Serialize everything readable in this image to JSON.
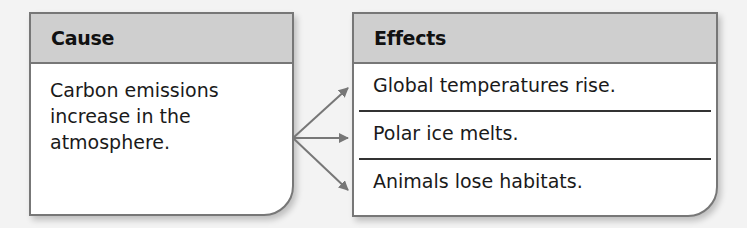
{
  "cause": {
    "header": "Cause",
    "lines": [
      "Carbon emissions",
      "increase in the",
      "atmosphere."
    ]
  },
  "effects": {
    "header": "Effects",
    "items": [
      "Global temperatures rise.",
      "Polar ice melts.",
      "Animals lose habitats."
    ]
  },
  "colors": {
    "header_bg": "#cfcfcf",
    "border": "#777777",
    "arrow": "#777777",
    "divider": "#333333"
  }
}
